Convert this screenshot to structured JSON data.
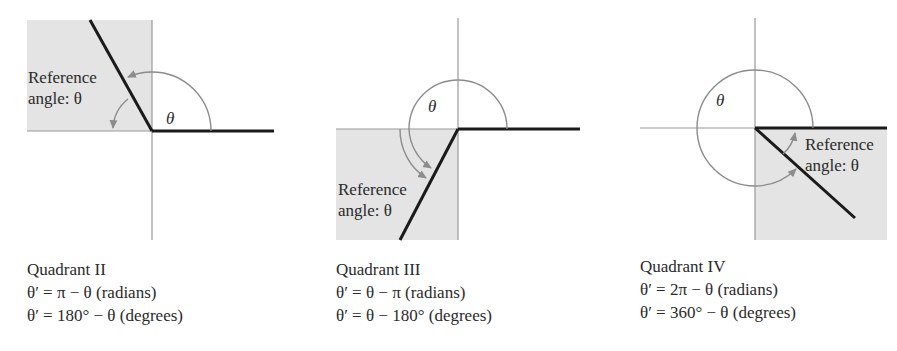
{
  "figure": {
    "colors": {
      "shade": "#e4e4e4",
      "axis": "#9a9a9a",
      "terminal_side": "#1a1a1a",
      "arc": "#8c8c8c",
      "text": "#2a2a2a"
    },
    "panels": [
      {
        "id": "quadrant-ii",
        "angle_label": "θ",
        "ref_label_line1": "Reference",
        "ref_label_line2": "angle: θ",
        "caption_title": "Quadrant II",
        "formula_radians": "θ′ = π − θ (radians)",
        "formula_degrees": "θ′ = 180° − θ (degrees)"
      },
      {
        "id": "quadrant-iii",
        "angle_label": "θ",
        "ref_label_line1": "Reference",
        "ref_label_line2": "angle: θ",
        "caption_title": "Quadrant III",
        "formula_radians": "θ′ = θ − π (radians)",
        "formula_degrees": "θ′ = θ − 180° (degrees)"
      },
      {
        "id": "quadrant-iv",
        "angle_label": "θ",
        "ref_label_line1": "Reference",
        "ref_label_line2": "angle: θ",
        "caption_title": "Quadrant IV",
        "formula_radians": "θ′ = 2π − θ (radians)",
        "formula_degrees": "θ′ = 360° − θ (degrees)"
      }
    ]
  }
}
